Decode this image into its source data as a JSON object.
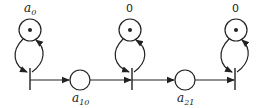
{
  "diagram": {
    "type": "petri-net",
    "stroke_color": "#222222",
    "marked_places": [
      {
        "id": "p0",
        "label_base": "a",
        "label_sub": "0",
        "token": true,
        "cx": 30,
        "cy": 30
      },
      {
        "id": "p1",
        "label_base": "0",
        "label_sub": "",
        "token": true,
        "cx": 130,
        "cy": 30
      },
      {
        "id": "p2",
        "label_base": "0",
        "label_sub": "",
        "token": true,
        "cx": 236,
        "cy": 30
      }
    ],
    "transitions": [
      {
        "id": "t0",
        "x": 30
      },
      {
        "id": "t1",
        "x": 132
      },
      {
        "id": "t2",
        "x": 235
      }
    ],
    "intermediate_places": [
      {
        "id": "q10",
        "label_base": "a",
        "label_sub": "10",
        "token": false,
        "cx": 80,
        "cy": 80
      },
      {
        "id": "q21",
        "label_base": "a",
        "label_sub": "21",
        "token": false,
        "cx": 185,
        "cy": 80
      }
    ],
    "arcs": [
      "p0 -> t0",
      "t0 -> p0",
      "p1 -> t1",
      "t1 -> p1",
      "p2 -> t2",
      "t2 -> p2",
      "t0 -> q10",
      "q10 -> t1",
      "t1 -> q21",
      "q21 -> t2"
    ]
  }
}
